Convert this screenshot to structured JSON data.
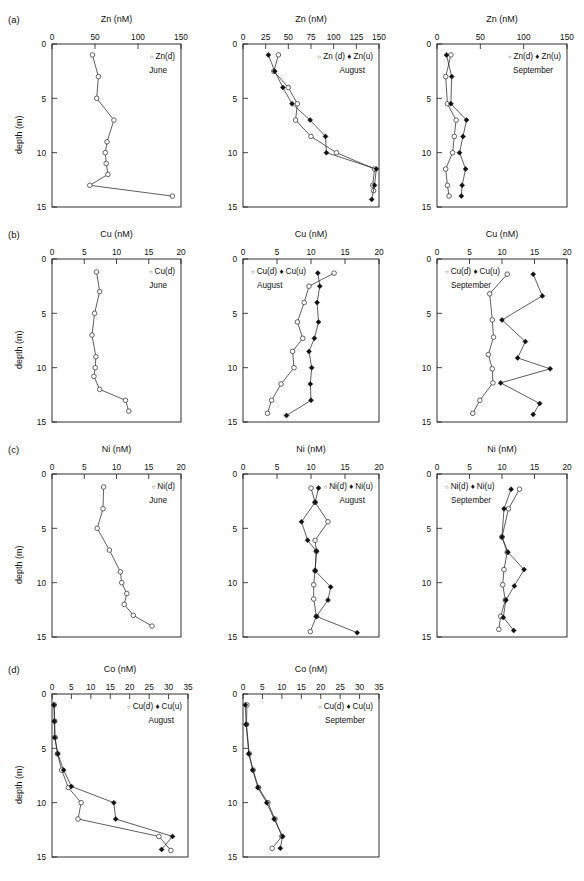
{
  "figure": {
    "rows": [
      {
        "label": "(a)",
        "metal": "Zn"
      },
      {
        "label": "(b)",
        "metal": "Cu"
      },
      {
        "label": "(c)",
        "metal": "Ni"
      },
      {
        "label": "(d)",
        "metal": "Co"
      }
    ],
    "ylabel": "depth (m)",
    "depth_ticks": [
      "0",
      "5",
      "10",
      "15"
    ]
  },
  "chart_data": [
    {
      "id": "zn-june",
      "type": "line",
      "panel": "(a)",
      "title": "Zn (nM)",
      "xlabel": "Zn (nM)",
      "ylabel": "depth (m)",
      "xlim": [
        0,
        150
      ],
      "ylim": [
        0,
        15
      ],
      "xticks": [
        0,
        50,
        100,
        150
      ],
      "yticks": [
        0,
        5,
        10,
        15
      ],
      "season": "June",
      "legend": [
        "Zn(d)"
      ],
      "legend_position": "top-right",
      "grid": false,
      "series": [
        {
          "name": "Zn(d)",
          "marker": "open-circle",
          "depth": [
            1,
            3,
            5,
            7,
            9,
            10,
            11,
            12,
            13,
            14
          ],
          "values": [
            47,
            54,
            52,
            72,
            64,
            62,
            63,
            65,
            44,
            140
          ]
        }
      ]
    },
    {
      "id": "zn-august",
      "type": "line",
      "panel": "(a)",
      "title": "Zn (nM)",
      "xlabel": "Zn (nM)",
      "ylabel": "depth (m)",
      "xlim": [
        0,
        150
      ],
      "ylim": [
        0,
        15
      ],
      "xticks": [
        0,
        25,
        50,
        75,
        100,
        125,
        150
      ],
      "yticks": [
        0,
        5,
        10,
        15
      ],
      "season": "August",
      "legend": [
        "Zn (d)",
        "Zn(u)"
      ],
      "legend_position": "top-right",
      "grid": false,
      "series": [
        {
          "name": "Zn (d)",
          "marker": "open-circle",
          "depth": [
            1,
            2.5,
            4,
            5.5,
            7,
            8.5,
            10,
            11.5,
            13,
            13.5
          ],
          "values": [
            39,
            34,
            50,
            60,
            58,
            75,
            103,
            145,
            143,
            144
          ]
        },
        {
          "name": "Zn(u)",
          "marker": "filled-diamond",
          "depth": [
            1,
            2.5,
            4,
            5.5,
            7,
            8.5,
            10,
            11.5,
            13,
            14.3
          ],
          "values": [
            28,
            35,
            44,
            54,
            74,
            91,
            92,
            147,
            145,
            142
          ]
        }
      ]
    },
    {
      "id": "zn-september",
      "type": "line",
      "panel": "(a)",
      "title": "Zn (nM)",
      "xlabel": "Zn (nM)",
      "ylabel": "depth (m)",
      "xlim": [
        0,
        150
      ],
      "ylim": [
        0,
        15
      ],
      "xticks": [
        0,
        50,
        100,
        150
      ],
      "yticks": [
        0,
        5,
        10,
        15
      ],
      "season": "September",
      "legend": [
        "Zn(d)",
        "Zn(u)"
      ],
      "legend_position": "top-right",
      "grid": false,
      "series": [
        {
          "name": "Zn(d)",
          "marker": "open-circle",
          "depth": [
            1,
            3,
            5.5,
            7,
            8.5,
            10,
            11.5,
            13,
            14
          ],
          "values": [
            16,
            10,
            12,
            22,
            20,
            18,
            10,
            12,
            14
          ]
        },
        {
          "name": "Zn(u)",
          "marker": "filled-diamond",
          "depth": [
            1,
            3,
            5.5,
            7,
            8.5,
            10,
            11.5,
            13,
            14
          ],
          "values": [
            11,
            17,
            16,
            34,
            30,
            26,
            33,
            29,
            28
          ]
        }
      ]
    },
    {
      "id": "cu-june",
      "type": "line",
      "panel": "(b)",
      "title": "Cu (nM)",
      "xlabel": "Cu (nM)",
      "ylabel": "depth (m)",
      "xlim": [
        0,
        20
      ],
      "ylim": [
        0,
        15
      ],
      "xticks": [
        0,
        5,
        10,
        15,
        20
      ],
      "yticks": [
        0,
        5,
        10,
        15
      ],
      "season": "June",
      "legend": [
        "Cu(d)"
      ],
      "legend_position": "top-right",
      "grid": false,
      "series": [
        {
          "name": "Cu(d)",
          "marker": "open-circle",
          "depth": [
            1.2,
            3,
            5,
            7,
            9,
            10,
            10.8,
            12,
            13,
            14
          ],
          "values": [
            6.9,
            7.4,
            6.6,
            6.2,
            6.8,
            6.7,
            6.5,
            7.4,
            11.4,
            11.9
          ]
        }
      ]
    },
    {
      "id": "cu-august",
      "type": "line",
      "panel": "(b)",
      "title": "Cu (nM)",
      "xlabel": "Cu (nM)",
      "ylabel": "depth (m)",
      "xlim": [
        0,
        20
      ],
      "ylim": [
        0,
        15
      ],
      "xticks": [
        0,
        5,
        10,
        15,
        20
      ],
      "yticks": [
        0,
        5,
        10,
        15
      ],
      "season": "August",
      "legend": [
        "Cu(d)",
        "Cu(u)"
      ],
      "legend_position": "top-left",
      "grid": false,
      "series": [
        {
          "name": "Cu(d)",
          "marker": "open-circle",
          "depth": [
            1.3,
            2.5,
            4,
            5.8,
            7.3,
            8.5,
            10,
            11.5,
            13,
            14.2
          ],
          "values": [
            13.4,
            9.7,
            9.0,
            8.0,
            8.8,
            7.3,
            7.5,
            5.6,
            4.2,
            3.6
          ]
        },
        {
          "name": "Cu(u)",
          "marker": "filled-diamond",
          "depth": [
            1.3,
            2.5,
            4,
            5.8,
            7.3,
            8.5,
            10,
            11.5,
            13,
            14.4
          ],
          "values": [
            11.0,
            11.3,
            10.9,
            11.1,
            10.5,
            9.7,
            10.1,
            9.9,
            10.0,
            6.4
          ]
        }
      ]
    },
    {
      "id": "cu-september",
      "type": "line",
      "panel": "(b)",
      "title": "Cu (nM)",
      "xlabel": "Cu (nM)",
      "ylabel": "depth (m)",
      "xlim": [
        0,
        20
      ],
      "ylim": [
        0,
        15
      ],
      "xticks": [
        0,
        5,
        10,
        15,
        20
      ],
      "yticks": [
        0,
        5,
        10,
        15
      ],
      "season": "September",
      "legend": [
        "Cu(d)",
        "Cu(u)"
      ],
      "legend_position": "top-left",
      "grid": false,
      "series": [
        {
          "name": "Cu(d)",
          "marker": "open-circle",
          "depth": [
            1.4,
            3.2,
            5.6,
            7.2,
            8.8,
            10.1,
            11.4,
            13,
            14.2
          ],
          "values": [
            10.8,
            8.1,
            8.5,
            8.7,
            7.9,
            8.5,
            8.6,
            6.6,
            5.5
          ]
        },
        {
          "name": "Cu(u)",
          "marker": "filled-diamond",
          "depth": [
            1.4,
            3.4,
            5.6,
            7.6,
            9.1,
            10.1,
            11.4,
            13.3,
            14.3
          ],
          "values": [
            14.8,
            16.2,
            10.0,
            13.6,
            12.4,
            17.4,
            9.8,
            15.8,
            14.8
          ]
        }
      ]
    },
    {
      "id": "ni-june",
      "type": "line",
      "panel": "(c)",
      "title": "Ni (nM)",
      "xlabel": "Ni (nM)",
      "ylabel": "depth (m)",
      "xlim": [
        0,
        20
      ],
      "ylim": [
        0,
        15
      ],
      "xticks": [
        0,
        5,
        10,
        15,
        20
      ],
      "yticks": [
        0,
        5,
        10,
        15
      ],
      "season": "June",
      "legend": [
        "Ni(d)"
      ],
      "legend_position": "top-right",
      "grid": false,
      "series": [
        {
          "name": "Ni(d)",
          "marker": "open-circle",
          "depth": [
            1.2,
            3.2,
            5,
            7,
            9,
            10,
            11,
            12,
            13,
            14
          ],
          "values": [
            8.0,
            7.9,
            7.0,
            8.9,
            10.6,
            10.8,
            11.6,
            11.2,
            12.6,
            15.5
          ]
        }
      ]
    },
    {
      "id": "ni-august",
      "type": "line",
      "panel": "(c)",
      "title": "Ni (nM)",
      "xlabel": "Ni (nM)",
      "ylabel": "depth (m)",
      "xlim": [
        0,
        20
      ],
      "ylim": [
        0,
        15
      ],
      "xticks": [
        0,
        5,
        10,
        15,
        20
      ],
      "yticks": [
        0,
        5,
        10,
        15
      ],
      "season": "August",
      "legend": [
        "Ni(d)",
        "Ni(u)"
      ],
      "legend_position": "top-right",
      "grid": false,
      "series": [
        {
          "name": "Ni(d)",
          "marker": "open-circle",
          "depth": [
            1.3,
            2.6,
            4.4,
            6.1,
            7.1,
            8.9,
            10.2,
            11.5,
            13.1,
            14.5
          ],
          "values": [
            10.0,
            10.6,
            12.5,
            10.6,
            10.8,
            10.6,
            10.4,
            10.4,
            10.8,
            9.9
          ]
        },
        {
          "name": "Ni(u)",
          "marker": "filled-diamond",
          "depth": [
            1.3,
            2.6,
            4.4,
            6.1,
            7.1,
            8.9,
            10.4,
            11.6,
            13.1,
            14.6
          ],
          "values": [
            11.1,
            10.6,
            8.6,
            9.5,
            10.8,
            10.6,
            12.9,
            12.5,
            10.8,
            16.8
          ]
        }
      ]
    },
    {
      "id": "ni-september",
      "type": "line",
      "panel": "(c)",
      "title": "Ni (nM)",
      "xlabel": "Ni (nM)",
      "ylabel": "depth (m)",
      "xlim": [
        0,
        20
      ],
      "ylim": [
        0,
        15
      ],
      "xticks": [
        0,
        5,
        10,
        15,
        20
      ],
      "yticks": [
        0,
        5,
        10,
        15
      ],
      "season": "September",
      "legend": [
        "Ni(d)",
        "Ni(u)"
      ],
      "legend_position": "top-left",
      "grid": false,
      "series": [
        {
          "name": "Ni(d)",
          "marker": "open-circle",
          "depth": [
            1.4,
            3.2,
            5.8,
            7.2,
            8.8,
            10.2,
            11.6,
            13.1,
            14.3
          ],
          "values": [
            12.7,
            11.0,
            10.0,
            10.8,
            10.3,
            10.1,
            10.5,
            9.8,
            9.5
          ]
        },
        {
          "name": "Ni(u)",
          "marker": "filled-diamond",
          "depth": [
            1.4,
            3.2,
            5.8,
            7.2,
            8.8,
            10.3,
            11.6,
            13.2,
            14.4
          ],
          "values": [
            11.4,
            10.3,
            10.0,
            10.9,
            13.4,
            11.9,
            10.6,
            10.2,
            11.8
          ]
        }
      ]
    },
    {
      "id": "co-august",
      "type": "line",
      "panel": "(d)",
      "title": "Co (nM)",
      "xlabel": "Co (nM)",
      "ylabel": "depth (m)",
      "xlim": [
        0,
        35
      ],
      "ylim": [
        0,
        15
      ],
      "xticks": [
        0,
        5,
        10,
        15,
        20,
        25,
        30,
        35
      ],
      "yticks": [
        0,
        5,
        10,
        15
      ],
      "season": "August",
      "legend": [
        "Cu(d)",
        "Cu(u)"
      ],
      "legend_position": "top-right",
      "grid": false,
      "series": [
        {
          "name": "Cu(d)",
          "marker": "open-circle",
          "depth": [
            1,
            2.5,
            4,
            5.5,
            7,
            8.6,
            10,
            11.5,
            13.1,
            14.4
          ],
          "values": [
            0.6,
            0.7,
            0.8,
            1.4,
            2.5,
            4.2,
            7.5,
            6.7,
            27.5,
            30.6
          ]
        },
        {
          "name": "Cu(u)",
          "marker": "filled-diamond",
          "depth": [
            1,
            2.5,
            4,
            5.5,
            7,
            8.5,
            10,
            11.5,
            13.1,
            14.3
          ],
          "values": [
            0.5,
            0.6,
            0.7,
            1.5,
            3.0,
            5.0,
            15.9,
            16.4,
            31.0,
            28.2
          ]
        }
      ]
    },
    {
      "id": "co-september",
      "type": "line",
      "panel": "(d)",
      "title": "Co (nM)",
      "xlabel": "Co (nM)",
      "ylabel": "depth (m)",
      "xlim": [
        0,
        35
      ],
      "ylim": [
        0,
        15
      ],
      "xticks": [
        0,
        5,
        10,
        15,
        20,
        25,
        30,
        35
      ],
      "yticks": [
        0,
        5,
        10,
        15
      ],
      "season": "September",
      "legend": [
        "Cu(d)",
        "Cu(u)"
      ],
      "legend_position": "top-right",
      "grid": false,
      "series": [
        {
          "name": "Cu(d)",
          "marker": "open-circle",
          "depth": [
            1,
            2.8,
            5.5,
            7,
            8.6,
            10,
            11.5,
            13.1,
            14.2
          ],
          "values": [
            1.0,
            0.9,
            1.6,
            2.6,
            4.0,
            6.4,
            8.2,
            10.0,
            7.5
          ]
        },
        {
          "name": "Cu(u)",
          "marker": "filled-diamond",
          "depth": [
            1,
            2.8,
            5.5,
            7,
            8.6,
            10,
            11.5,
            13.1,
            14.2
          ],
          "values": [
            0.6,
            0.8,
            1.5,
            2.5,
            3.8,
            6.1,
            8.0,
            10.2,
            9.6
          ]
        }
      ]
    }
  ]
}
